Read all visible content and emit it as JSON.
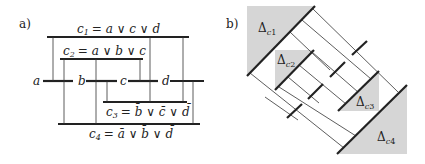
{
  "panel_a": {
    "label": "a)",
    "variables": [
      "a",
      "b",
      "c",
      "d"
    ],
    "clauses": [
      {
        "name": "c",
        "index": "1",
        "formula": "= a ∨ c ∨ d"
      },
      {
        "name": "c",
        "index": "2",
        "formula": "= a ∨ b ∨ c"
      },
      {
        "name": "c",
        "index": "3",
        "formula_parts": [
          "= ",
          "b̄",
          " ∨ ",
          "c̄",
          " ∨ ",
          "d̄"
        ]
      },
      {
        "name": "c",
        "index": "4",
        "formula_parts": [
          "= ",
          "ā",
          " ∨ ",
          "b̄",
          " ∨ ",
          "d̄"
        ]
      }
    ]
  },
  "panel_b": {
    "label": "b)",
    "regions": [
      {
        "symbol": "Δ",
        "sub": "c",
        "sub_index": "1"
      },
      {
        "symbol": "Δ",
        "sub": "c",
        "sub_index": "2"
      },
      {
        "symbol": "Δ",
        "sub": "c",
        "sub_index": "3"
      },
      {
        "symbol": "Δ",
        "sub": "c",
        "sub_index": "4"
      }
    ]
  },
  "colors": {
    "ink": "#222222",
    "shade": "#d6d6d6",
    "background": "#ffffff"
  }
}
